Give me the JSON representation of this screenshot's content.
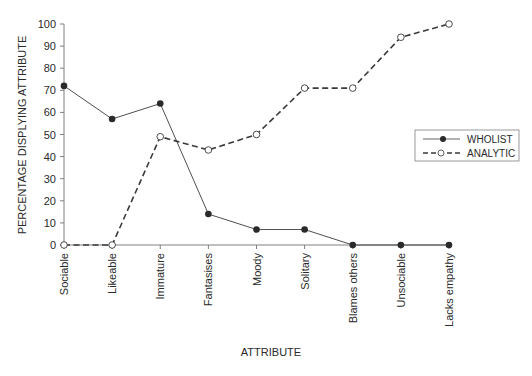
{
  "chart_data": {
    "type": "line",
    "title": "",
    "xlabel": "ATTRIBUTE",
    "ylabel": "PERCENTAGE DISPLYING ATTRIBUTE",
    "ylim": [
      0,
      100
    ],
    "yticks": [
      0,
      10,
      20,
      30,
      40,
      50,
      60,
      70,
      80,
      90,
      100
    ],
    "grid": false,
    "legend_position": "right-middle",
    "categories": [
      "Sociable",
      "Likeable",
      "Immature",
      "Fantasises",
      "Moody",
      "Solitary",
      "Blames others",
      "Unsociable",
      "Lacks empathy"
    ],
    "series": [
      {
        "name": "WHOLIST",
        "style": "solid",
        "marker": "filled-circle",
        "values": [
          72,
          57,
          64,
          14,
          7,
          7,
          0,
          0,
          0
        ]
      },
      {
        "name": "ANALYTIC",
        "style": "dashed",
        "marker": "open-circle",
        "values": [
          0,
          0,
          49,
          43,
          50,
          71,
          71,
          94,
          100
        ]
      }
    ]
  },
  "colors": {
    "line": "#3a3a3a",
    "marker_fill": "#2a2a2a",
    "axis": "#808080",
    "background": "#ffffff"
  }
}
